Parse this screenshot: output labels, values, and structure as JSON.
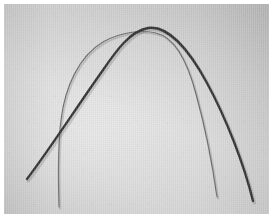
{
  "figure": {
    "kind": "photograph",
    "caption": "",
    "plate": {
      "background_color": "#d4d4d4",
      "highlight_color": "#e8e8e8",
      "shade_color": "#b5b5b5",
      "margin_color": "#ffffff",
      "margin_px": 4,
      "width_px": 265,
      "height_px": 210,
      "texture": "vertical-scanlines"
    },
    "objects": [
      {
        "id": "thick-archwire",
        "label": "thick archwire",
        "color": "#333333",
        "stroke_width_px": 2.3,
        "shape": "broad-flat-apex-arch",
        "apex_x_px": 144,
        "apex_y_px": 24,
        "left_end_x_px": 23,
        "left_end_y_px": 175,
        "right_end_x_px": 249,
        "right_end_y_px": 197,
        "path": "M 23 175 C 48 142, 72 104, 99 66 C 112 47, 126 27, 144 24 C 163 21, 184 44, 203 79 C 222 114, 240 160, 249 197"
      },
      {
        "id": "thin-archwire",
        "label": "thin archwire",
        "color": "#6b6b6b",
        "stroke_width_px": 1.15,
        "shape": "narrow-round-apex-arch",
        "apex_x_px": 152,
        "apex_y_px": 29,
        "left_end_x_px": 55,
        "left_end_y_px": 203,
        "right_end_x_px": 213,
        "right_end_y_px": 193,
        "path": "M 55 203 C 54 170, 54 140, 57 116 C 61 83, 75 52, 99 38 C 118 27, 140 26, 152 29 C 170 33, 183 56, 192 90 C 202 126, 209 165, 213 193"
      }
    ],
    "crossings": [
      {
        "x_px": 60,
        "y_px": 128,
        "between": [
          "thick-archwire",
          "thin-archwire"
        ]
      },
      {
        "x_px": 142,
        "y_px": 25,
        "between": [
          "thick-archwire",
          "thin-archwire"
        ]
      }
    ]
  }
}
